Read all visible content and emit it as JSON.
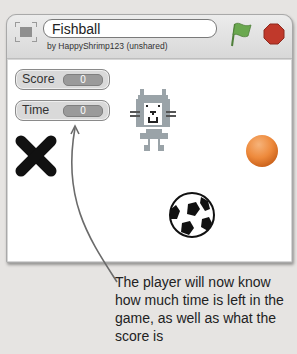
{
  "window": {
    "project_title": "Fishball",
    "byline": "by HappyShrimp123 (unshared)",
    "icons": {
      "fullscreen": "fullscreen-icon",
      "green_flag": "green-flag-icon",
      "stop": "stop-icon"
    },
    "colors": {
      "flag": "#6aa84f",
      "stop": "#c0392b",
      "monitor_value_bg": "#9a9a9a",
      "orange_ball": "#ee8a3c"
    }
  },
  "stage": {
    "monitors": [
      {
        "label": "Score",
        "value": "0"
      },
      {
        "label": "Time",
        "value": "0"
      }
    ],
    "sprites": [
      "x-mark",
      "cat",
      "soccer-ball",
      "orange-ball"
    ]
  },
  "annotation": {
    "text": "The player will now know how much time is left in the game, as well as what the score is"
  }
}
